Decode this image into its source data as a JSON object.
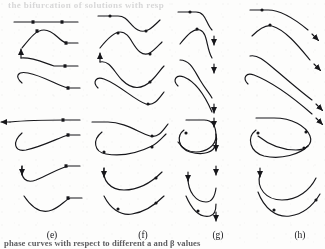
{
  "figure": {
    "background_color": "#fdfdfc",
    "ink_color": "#16161a",
    "ghost_text": "the bifurcation of solutions with resp",
    "caption_partial": "phase  curves  with  respect to  different a and β values",
    "panel_count": 4,
    "rows_per_panel": 8,
    "marker_names": [
      "arrow-head-marker",
      "dot-marker"
    ],
    "panels": [
      {
        "id": "e",
        "label": "(e)",
        "label_x": 52,
        "label_y": 230,
        "description": "trajectories flattening to horizontal right tails with square dot markers"
      },
      {
        "id": "f",
        "label": "(f)",
        "label_x": 143,
        "label_y": 230,
        "description": "S-shaped oscillatory trajectories ending in rising tails with round dot markers"
      },
      {
        "id": "g",
        "label": "(g)",
        "label_x": 218,
        "label_y": 230,
        "description": "trajectories terminating in downward arrow heads aligned in a vertical column"
      },
      {
        "id": "h",
        "label": "(h)",
        "label_x": 300,
        "label_y": 230,
        "description": "long sweeping trajectories with arrow heads at far right, clipped at panel edge"
      }
    ]
  },
  "chart_data": {
    "type": "line",
    "title": "",
    "subtitle": "",
    "xlabel": "",
    "ylabel": "",
    "grid": false,
    "legend": "none",
    "panel_labels": [
      "(e)",
      "(f)",
      "(g)",
      "(h)"
    ],
    "note": "Each panel is a stacked column of 8 qualitative trajectory curves; values are shape descriptors read off the scan, not numeric axis data.",
    "series": [
      {
        "name": "e1",
        "panel": "e",
        "path": "M 14 22 L 78 22",
        "markers": [
          {
            "type": "dot",
            "x": 33,
            "y": 22
          },
          {
            "type": "dot",
            "x": 62,
            "y": 22
          }
        ],
        "arrow": null
      },
      {
        "name": "e2",
        "panel": "e",
        "path": "M 22 48 C 30 38 36 30 44 30 C 54 30 58 40 66 43 L 78 43",
        "markers": [
          {
            "type": "dot",
            "x": 37,
            "y": 31
          },
          {
            "type": "dot",
            "x": 66,
            "y": 43
          }
        ],
        "arrow": null
      },
      {
        "name": "e3",
        "panel": "e",
        "path": "M 21 58 C 32 57 42 62 54 66 L 78 66",
        "markers": [
          {
            "type": "dot",
            "x": 65,
            "y": 66
          }
        ],
        "arrow": {
          "x": 21,
          "y": 58,
          "dir": "up"
        }
      },
      {
        "name": "e4",
        "panel": "e",
        "path": "M 22 83 C 14 76 18 71 28 73 C 44 76 58 86 68 88 L 80 88",
        "markers": [
          {
            "type": "dot",
            "x": 68,
            "y": 88
          }
        ],
        "arrow": null
      },
      {
        "name": "e5",
        "panel": "e",
        "path": "M 10 122 C 30 120 50 120 66 120 L 80 120",
        "markers": [
          {
            "type": "dot",
            "x": 63,
            "y": 120
          }
        ],
        "arrow": {
          "x": 10,
          "y": 122,
          "dir": "left"
        }
      },
      {
        "name": "e6",
        "panel": "e",
        "path": "M 22 133 C 12 142 14 152 26 150 C 44 146 58 138 68 135 L 80 135",
        "markers": [
          {
            "type": "dot",
            "x": 68,
            "y": 135
          }
        ],
        "arrow": null
      },
      {
        "name": "e7",
        "panel": "e",
        "path": "M 22 166 C 20 178 26 184 36 180 C 50 174 60 168 68 166 L 80 166",
        "markers": [
          {
            "type": "dot",
            "x": 66,
            "y": 166
          }
        ],
        "arrow": {
          "x": 22,
          "y": 166,
          "dir": "down"
        }
      },
      {
        "name": "e8",
        "panel": "e",
        "path": "M 24 196 C 32 208 42 214 52 210 C 60 207 64 201 70 198 L 82 198",
        "markers": [
          {
            "type": "dot",
            "x": 68,
            "y": 198
          }
        ],
        "arrow": null
      },
      {
        "name": "f1",
        "panel": "f",
        "path": "M 98 16 L 118 16 C 128 16 130 26 138 30 C 146 34 152 28 160 20",
        "markers": [
          {
            "type": "dot",
            "x": 110,
            "y": 16
          },
          {
            "type": "dot",
            "x": 146,
            "y": 31
          }
        ],
        "arrow": null
      },
      {
        "name": "f2",
        "panel": "f",
        "path": "M 100 48 C 108 38 114 32 120 32 C 130 32 132 46 140 52 C 148 58 154 50 162 42",
        "markers": [
          {
            "type": "dot",
            "x": 118,
            "y": 33
          },
          {
            "type": "dot",
            "x": 150,
            "y": 54
          }
        ],
        "arrow": null
      },
      {
        "name": "f3",
        "panel": "f",
        "path": "M 100 62 C 110 60 114 72 122 80 C 132 90 142 90 152 80 C 158 74 160 70 164 66",
        "markers": [
          {
            "type": "dot",
            "x": 150,
            "y": 82
          }
        ],
        "arrow": {
          "x": 100,
          "y": 62,
          "dir": "up"
        }
      },
      {
        "name": "f4",
        "panel": "f",
        "path": "M 98 88 C 92 82 96 76 104 79 C 120 85 134 100 146 104 C 154 106 158 100 164 92",
        "markers": [
          {
            "type": "dot",
            "x": 148,
            "y": 104
          }
        ],
        "arrow": null
      },
      {
        "name": "f5",
        "panel": "f",
        "path": "M 92 122 L 108 122 C 124 122 138 132 150 136 C 158 138 162 132 168 124",
        "markers": [
          {
            "type": "dot",
            "x": 152,
            "y": 136
          }
        ],
        "arrow": null
      },
      {
        "name": "f6",
        "panel": "f",
        "path": "M 102 132 C 92 140 94 152 106 154 C 124 157 140 152 152 146 C 158 143 162 138 166 134",
        "markers": [
          {
            "type": "dot",
            "x": 104,
            "y": 152
          },
          {
            "type": "dot",
            "x": 152,
            "y": 147
          }
        ],
        "arrow": null
      },
      {
        "name": "f7",
        "panel": "f",
        "path": "M 104 168 C 102 180 110 190 124 190 C 140 190 152 182 162 172",
        "markers": [
          {
            "type": "dot",
            "x": 156,
            "y": 178
          }
        ],
        "arrow": {
          "x": 104,
          "y": 168,
          "dir": "down"
        }
      },
      {
        "name": "f8",
        "panel": "f",
        "path": "M 104 196 C 110 208 120 216 132 214 C 146 212 156 204 164 196",
        "markers": [
          {
            "type": "dot",
            "x": 118,
            "y": 209
          },
          {
            "type": "dot",
            "x": 156,
            "y": 203
          }
        ],
        "arrow": null
      },
      {
        "name": "g1",
        "panel": "g",
        "path": "M 178 12 L 196 12 C 206 12 206 24 212 30",
        "markers": [
          {
            "type": "dot",
            "x": 190,
            "y": 12
          }
        ],
        "arrow": {
          "x": 214,
          "y": 36,
          "dir": "down"
        }
      },
      {
        "name": "g2",
        "panel": "g",
        "path": "M 180 44 C 188 34 194 28 200 30 C 208 33 206 48 212 58",
        "markers": [
          {
            "type": "dot",
            "x": 197,
            "y": 29
          }
        ],
        "arrow": {
          "x": 214,
          "y": 64,
          "dir": "down"
        }
      },
      {
        "name": "g3",
        "panel": "g",
        "path": "M 180 60 C 190 60 194 70 200 80 C 206 90 210 94 212 98",
        "markers": [],
        "arrow": {
          "x": 214,
          "y": 104,
          "dir": "down"
        }
      },
      {
        "name": "g4",
        "panel": "g",
        "path": "M 178 86 C 172 80 176 74 184 77 C 196 82 206 98 212 112",
        "markers": [],
        "arrow": {
          "x": 214,
          "y": 118,
          "dir": "down"
        }
      },
      {
        "name": "g5",
        "panel": "g",
        "path": "M 186 120 L 204 120 C 214 120 216 128 216 136 C 216 146 206 152 196 152 C 188 152 182 148 178 142",
        "markers": [],
        "arrow": {
          "x": 216,
          "y": 142,
          "dir": "down"
        }
      },
      {
        "name": "g6",
        "panel": "g",
        "path": "M 184 130 C 176 136 178 148 190 152 C 204 156 214 152 216 144 C 217 140 217 138 216 134",
        "markers": [
          {
            "type": "dot",
            "x": 186,
            "y": 133
          }
        ],
        "arrow": {
          "x": 216,
          "y": 166,
          "dir": "down"
        }
      },
      {
        "name": "g7",
        "panel": "g",
        "path": "M 188 178 C 188 192 196 202 206 202 C 212 202 215 196 216 188",
        "markers": [],
        "arrow": {
          "x": 188,
          "y": 172,
          "dir": "down"
        }
      },
      {
        "name": "g8",
        "panel": "g",
        "path": "M 186 196 C 192 210 200 218 210 216 C 215 215 216 210 216 204",
        "markers": [
          {
            "type": "dot",
            "x": 198,
            "y": 211
          }
        ],
        "arrow": {
          "x": 216,
          "y": 212,
          "dir": "down"
        }
      },
      {
        "name": "h1",
        "panel": "h",
        "path": "M 250 10 L 268 10 C 282 10 296 20 308 30",
        "markers": [
          {
            "type": "dot",
            "x": 262,
            "y": 10
          }
        ],
        "arrow": {
          "x": 312,
          "y": 34,
          "dir": "down-right"
        }
      },
      {
        "name": "h2",
        "panel": "h",
        "path": "M 252 36 C 260 28 266 24 272 26 C 286 30 300 48 310 60",
        "markers": [
          {
            "type": "dot",
            "x": 270,
            "y": 25
          }
        ],
        "arrow": {
          "x": 314,
          "y": 64,
          "dir": "down-right"
        }
      },
      {
        "name": "h3",
        "panel": "h",
        "path": "M 250 56 C 258 54 266 62 278 72 C 292 84 304 94 312 100",
        "markers": [],
        "arrow": {
          "x": 316,
          "y": 104,
          "dir": "down-right"
        }
      },
      {
        "name": "h4",
        "panel": "h",
        "path": "M 248 84 C 242 78 246 72 254 75 C 272 82 296 100 312 114",
        "markers": [],
        "arrow": {
          "x": 316,
          "y": 118,
          "dir": "down-right"
        }
      },
      {
        "name": "h5",
        "panel": "h",
        "path": "M 256 118 L 274 118 C 292 118 306 126 310 136 C 313 144 306 150 296 150 C 282 150 268 144 258 136",
        "markers": [
          {
            "type": "dot",
            "x": 306,
            "y": 132
          }
        ],
        "arrow": null
      },
      {
        "name": "h6",
        "panel": "h",
        "path": "M 256 130 C 246 138 250 152 264 156 C 282 160 300 154 308 146",
        "markers": [
          {
            "type": "dot",
            "x": 258,
            "y": 133
          },
          {
            "type": "dot",
            "x": 304,
            "y": 148
          }
        ],
        "arrow": null
      },
      {
        "name": "h7",
        "panel": "h",
        "path": "M 260 174 C 256 188 266 200 282 200 C 298 200 310 190 316 178",
        "markers": [],
        "arrow": {
          "x": 260,
          "y": 168,
          "dir": "down"
        }
      },
      {
        "name": "h8",
        "panel": "h",
        "path": "M 258 192 C 264 208 276 218 290 216 C 304 214 314 204 320 194",
        "markers": [
          {
            "type": "dot",
            "x": 274,
            "y": 210
          },
          {
            "type": "dot",
            "x": 316,
            "y": 200
          }
        ],
        "arrow": null
      }
    ]
  }
}
